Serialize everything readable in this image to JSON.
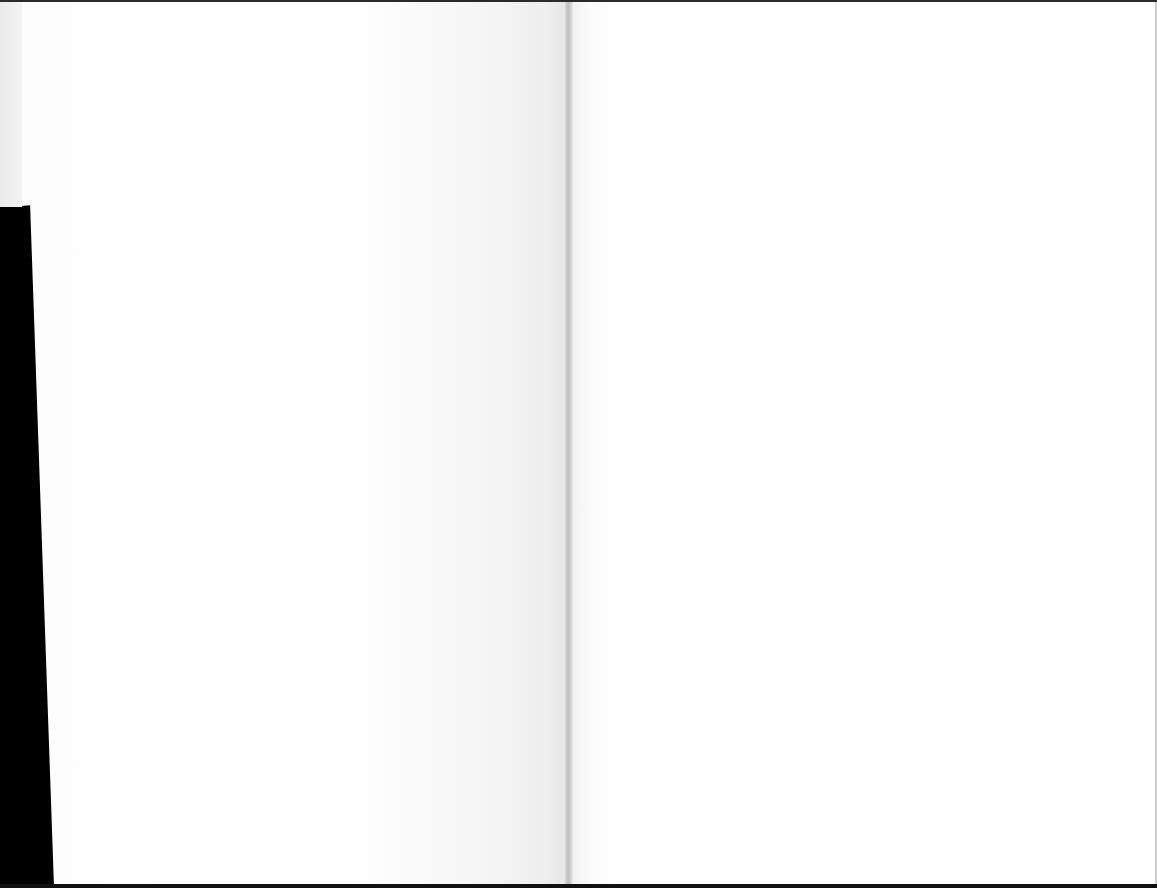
{
  "document": {
    "type": "scanned-book-spread",
    "pages": [
      {
        "side": "left",
        "text": "",
        "content": "blank"
      },
      {
        "side": "right",
        "text": "",
        "content": "blank"
      }
    ]
  },
  "colors": {
    "paper": "#ffffff",
    "gutter_shadow": "#bdbdbd",
    "scan_background": "#000000"
  }
}
